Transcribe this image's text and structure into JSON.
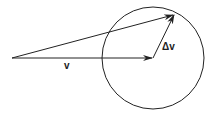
{
  "diagram": {
    "labels": {
      "v": "v",
      "delta_v": "Δv"
    },
    "stroke_color": "#222222",
    "origin": [
      12,
      58
    ],
    "v_tip": [
      153,
      58
    ],
    "delta_v_tip": [
      175,
      14
    ],
    "circle": {
      "cx": 153,
      "cy": 58,
      "r": 51
    }
  }
}
